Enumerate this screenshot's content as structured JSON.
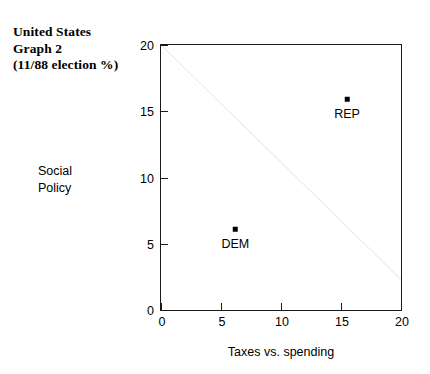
{
  "title": {
    "line1": "United States",
    "line2": "Graph 2",
    "line3": "(11/88 election %)"
  },
  "axes": {
    "ylabel_line1": "Social",
    "ylabel_line2": "Policy",
    "xlabel": "Taxes vs. spending",
    "ytick_labels": [
      "0",
      "5",
      "10",
      "15",
      "20"
    ],
    "xtick_labels": [
      "0",
      "5",
      "10",
      "15",
      "20"
    ]
  },
  "chart_data": {
    "type": "scatter",
    "title": "United States Graph 2 (11/88 election %)",
    "xlabel": "Taxes vs. spending",
    "ylabel": "Social Policy",
    "xlim": [
      0,
      20
    ],
    "ylim": [
      0,
      20
    ],
    "xticks": [
      0,
      5,
      10,
      15,
      20
    ],
    "yticks": [
      0,
      5,
      10,
      15,
      20
    ],
    "grid": false,
    "legend": "none",
    "points": [
      {
        "label": "DEM",
        "x": 6.2,
        "y": 6.1,
        "marker": "square",
        "color": "#000000"
      },
      {
        "label": "REP",
        "x": 15.5,
        "y": 15.9,
        "marker": "square",
        "color": "#000000"
      }
    ],
    "line": {
      "name": "dimension line",
      "x": [
        0,
        20
      ],
      "y": [
        20,
        2.3
      ],
      "color": "#1a1a1a",
      "style": "solid"
    }
  }
}
